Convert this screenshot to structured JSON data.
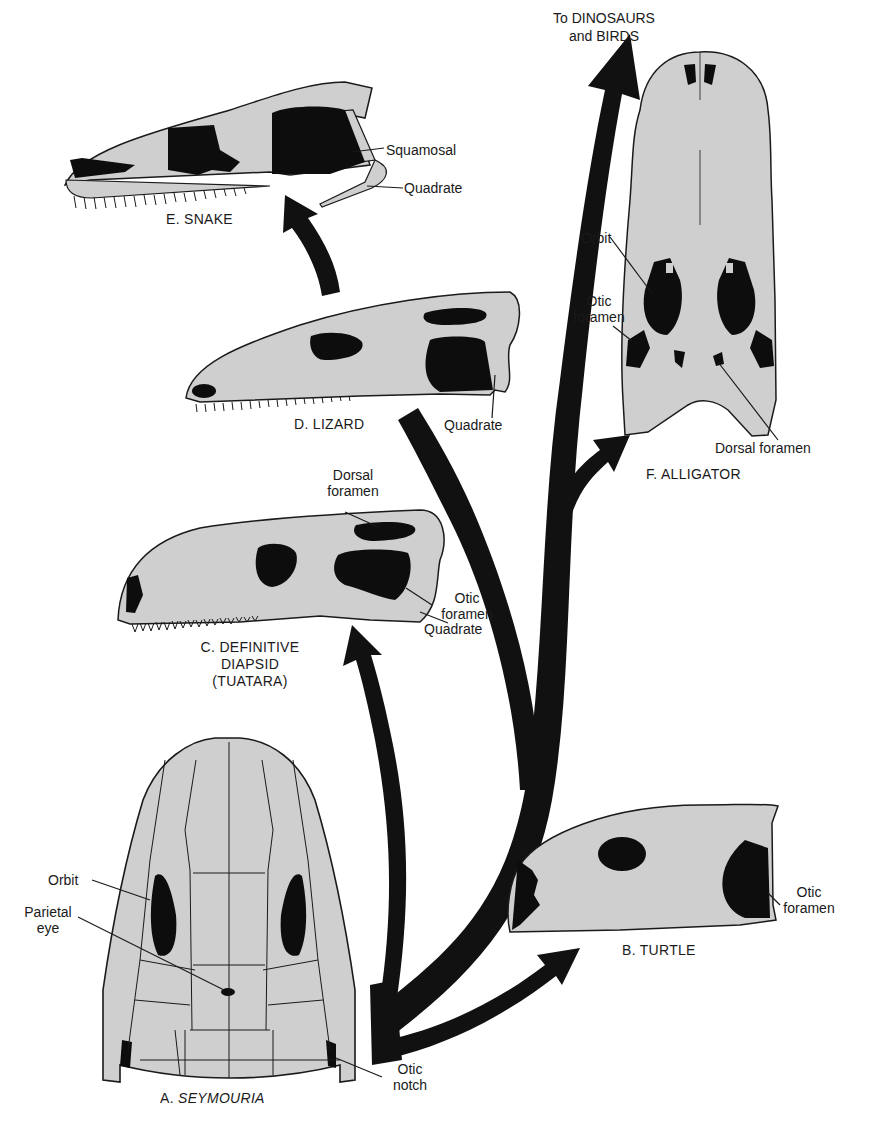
{
  "figure": {
    "colors": {
      "bone": "#cfcfcf",
      "opening": "#0d0d0d",
      "outline": "#1a1a1a",
      "background": "#ffffff",
      "arrow": "#111111"
    }
  },
  "top_label": {
    "line1": "To DINOSAURS",
    "line2": "and BIRDS"
  },
  "skulls": {
    "seymouria": {
      "caption_prefix": "A. ",
      "caption_name": "SEYMOURIA",
      "labels": {
        "orbit": "Orbit",
        "parietal_line1": "Parietal",
        "parietal_line2": "eye",
        "otic_line1": "Otic",
        "otic_line2": "notch"
      }
    },
    "turtle": {
      "caption": "B. TURTLE",
      "labels": {
        "otic_line1": "Otic",
        "otic_line2": "foramen"
      }
    },
    "tuatara": {
      "caption_line1": "C. DEFINITIVE",
      "caption_line2": "DIAPSID",
      "caption_line3": "(TUATARA)",
      "labels": {
        "dorsal_line1": "Dorsal",
        "dorsal_line2": "foramen",
        "otic_line1": "Otic",
        "otic_line2": "foramen",
        "quadrate": "Quadrate"
      }
    },
    "lizard": {
      "caption": "D. LIZARD",
      "labels": {
        "quadrate": "Quadrate"
      }
    },
    "snake": {
      "caption": "E. SNAKE",
      "labels": {
        "squamosal": "Squamosal",
        "quadrate": "Quadrate"
      }
    },
    "alligator": {
      "caption": "F. ALLIGATOR",
      "labels": {
        "orbit": "Orbit",
        "otic_line1": "Otic",
        "otic_line2": "foramen",
        "dorsal": "Dorsal foramen"
      }
    }
  }
}
